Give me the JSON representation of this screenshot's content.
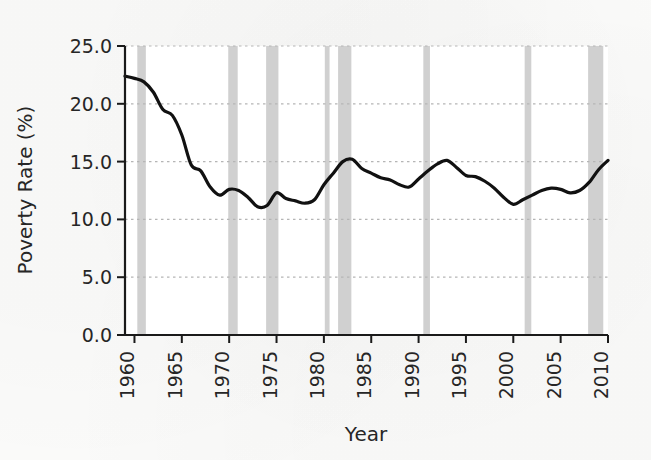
{
  "chart_data": {
    "type": "line",
    "title": "",
    "xlabel": "Year",
    "ylabel": "Poverty Rate (%)",
    "xlim": [
      1959,
      2010
    ],
    "ylim": [
      0.0,
      25.0
    ],
    "grid": true,
    "legend": false,
    "x_ticks": [
      1960,
      1965,
      1970,
      1975,
      1980,
      1985,
      1990,
      1995,
      2000,
      2005,
      2010
    ],
    "x_tick_labels": [
      "1960",
      "1965",
      "1970",
      "1975",
      "1980",
      "1985",
      "1990",
      "1995",
      "2000",
      "2005",
      "2010"
    ],
    "x_tick_label_rotation": 90,
    "y_ticks": [
      0.0,
      5.0,
      10.0,
      15.0,
      20.0,
      25.0
    ],
    "y_tick_labels": [
      "0.0",
      "5.0",
      "10.0",
      "15.0",
      "20.0",
      "25.0"
    ],
    "series": [
      {
        "name": "Poverty Rate",
        "color": "#111111",
        "line_width": 3.2,
        "x": [
          1959,
          1960,
          1961,
          1962,
          1963,
          1964,
          1965,
          1966,
          1967,
          1968,
          1969,
          1970,
          1971,
          1972,
          1973,
          1974,
          1975,
          1976,
          1977,
          1978,
          1979,
          1980,
          1981,
          1982,
          1983,
          1984,
          1985,
          1986,
          1987,
          1988,
          1989,
          1990,
          1991,
          1992,
          1993,
          1994,
          1995,
          1996,
          1997,
          1998,
          1999,
          2000,
          2001,
          2002,
          2003,
          2004,
          2005,
          2006,
          2007,
          2008,
          2009,
          2010
        ],
        "y": [
          22.4,
          22.2,
          21.9,
          21.0,
          19.5,
          19.0,
          17.3,
          14.7,
          14.2,
          12.8,
          12.1,
          12.6,
          12.5,
          11.9,
          11.1,
          11.2,
          12.3,
          11.8,
          11.6,
          11.4,
          11.7,
          13.0,
          14.0,
          15.0,
          15.2,
          14.4,
          14.0,
          13.6,
          13.4,
          13.0,
          12.8,
          13.5,
          14.2,
          14.8,
          15.1,
          14.5,
          13.8,
          13.7,
          13.3,
          12.7,
          11.9,
          11.3,
          11.7,
          12.1,
          12.5,
          12.7,
          12.6,
          12.3,
          12.5,
          13.2,
          14.3,
          15.1
        ],
        "annotations": [
          {
            "label": "peak-1959",
            "x": 1959,
            "y": 22.4
          },
          {
            "label": "trough-1973",
            "x": 1973,
            "y": 11.1
          },
          {
            "label": "peak-1983",
            "x": 1983,
            "y": 15.2
          },
          {
            "label": "peak-1993",
            "x": 1993,
            "y": 15.1
          },
          {
            "label": "trough-2000",
            "x": 2000,
            "y": 11.3
          },
          {
            "label": "end-2010",
            "x": 2010,
            "y": 15.1
          }
        ]
      }
    ],
    "shaded_bands": {
      "name": "Recessions",
      "color": "#c8c8c8",
      "opacity": 0.85,
      "orientation": "vertical",
      "spans": [
        {
          "label": "1960-1961",
          "start": 1960.3,
          "end": 1961.2
        },
        {
          "label": "1969-1970",
          "start": 1969.9,
          "end": 1970.9
        },
        {
          "label": "1973-1975",
          "start": 1973.9,
          "end": 1975.2
        },
        {
          "label": "1980",
          "start": 1980.1,
          "end": 1980.6
        },
        {
          "label": "1981-1982",
          "start": 1981.5,
          "end": 1982.9
        },
        {
          "label": "1990-1991",
          "start": 1990.5,
          "end": 1991.2
        },
        {
          "label": "2001",
          "start": 2001.2,
          "end": 2001.9
        },
        {
          "label": "2007-2009",
          "start": 2007.9,
          "end": 2009.5
        }
      ]
    },
    "grid_color": "#b5b5b5",
    "axis_color": "#1a1a1a",
    "background_color": "#ffffff"
  }
}
